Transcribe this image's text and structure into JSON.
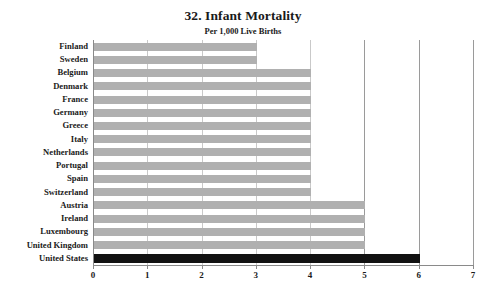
{
  "chart_data": {
    "type": "bar",
    "orientation": "horizontal",
    "title": "32. Infant Mortality",
    "subtitle": "Per 1,000 Live Births",
    "xlabel": "",
    "ylabel": "",
    "xlim": [
      0,
      7
    ],
    "xticks": [
      "0",
      "1",
      "2",
      "3",
      "4",
      "5",
      "6",
      "7"
    ],
    "grid": true,
    "legend": false,
    "bar_color": "#b0b0b0",
    "highlight_color": "#111111",
    "highlight_category": "United States",
    "categories": [
      "Finland",
      "Sweden",
      "Belgium",
      "Denmark",
      "France",
      "Germany",
      "Greece",
      "Italy",
      "Netherlands",
      "Portugal",
      "Spain",
      "Switzerland",
      "Austria",
      "Ireland",
      "Luxembourg",
      "United Kingdom",
      "United States"
    ],
    "values": [
      3,
      3,
      4,
      4,
      4,
      4,
      4,
      4,
      4,
      4,
      4,
      4,
      5,
      5,
      5,
      5,
      6
    ]
  }
}
